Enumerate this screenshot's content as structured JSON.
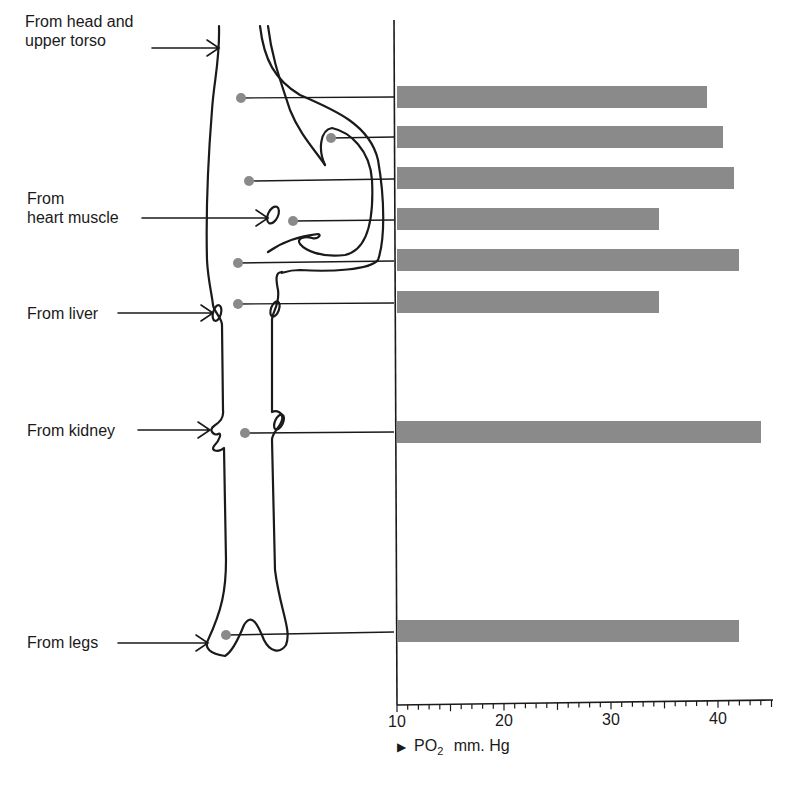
{
  "figure": {
    "labels": {
      "head": [
        "From head and",
        "upper torso"
      ],
      "heart": [
        "From",
        "heart muscle"
      ],
      "liver": "From liver",
      "kidney": "From kidney",
      "legs": "From legs"
    },
    "axis": {
      "ticks": [
        "10",
        "20",
        "30",
        "40"
      ],
      "title_marker": "▶",
      "title_main": "PO",
      "title_sub": "2",
      "title_unit": "mm. Hg"
    }
  },
  "colors": {
    "bar": "#8a8a8a",
    "line": "#1a1a1a",
    "dot": "#8a8a8a"
  },
  "chart_data": {
    "type": "bar",
    "orientation": "horizontal",
    "title": "",
    "xlabel": "PO2 mm. Hg",
    "ylabel": "",
    "xlim": [
      10,
      45
    ],
    "xticks": [
      10,
      20,
      30,
      40
    ],
    "categories": [
      "Vena cava (upper, below head/upper torso inflow)",
      "Right atrium (upper)",
      "Vena cava (mid)",
      "Right atrium (near coronary sinus / heart muscle inflow)",
      "Right ventricle region",
      "Vena cava (below heart, above liver)",
      "Vena cava (at kidney inflow)",
      "Vena cava (at legs inflow)"
    ],
    "values": [
      39,
      40.5,
      41.5,
      34.5,
      42,
      34.5,
      44,
      42
    ],
    "grid": false,
    "legend": null
  }
}
